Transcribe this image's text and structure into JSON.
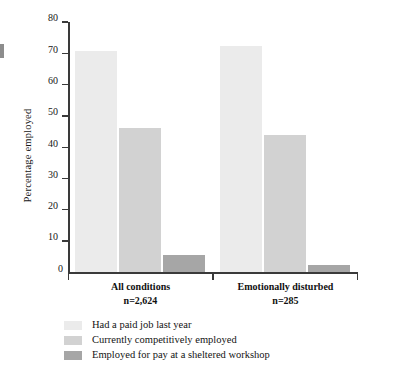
{
  "chart_data": {
    "type": "bar",
    "title": "",
    "xlabel": "",
    "ylabel": "Percentage employed",
    "ylim": [
      0,
      80
    ],
    "ytick_labels": [
      "0",
      "10",
      "20",
      "30",
      "40",
      "50",
      "60",
      "70",
      "80"
    ],
    "ytick_values": [
      0,
      10,
      20,
      30,
      40,
      50,
      60,
      70,
      80
    ],
    "grid": false,
    "legend_position": "bottom-left",
    "categories": [
      "All conditions",
      "Emotionally disturbed"
    ],
    "category_sublabels": [
      "n=2,624",
      "n=285"
    ],
    "series": [
      {
        "name": "Had a paid job last year",
        "color": "#ebebeb",
        "values": [
          70.8,
          72.4
        ]
      },
      {
        "name": "Currently competitively employed",
        "color": "#d2d2d2",
        "values": [
          46.2,
          43.8
        ]
      },
      {
        "name": "Employed for pay at a sheltered workshop",
        "color": "#a6a6a6",
        "values": [
          5.6,
          2.4
        ]
      }
    ]
  },
  "axis": {
    "y_title": "Percentage employed"
  },
  "legend": {
    "items": [
      {
        "label": "Had a paid job last year",
        "color": "#ebebeb"
      },
      {
        "label": "Currently competitively employed",
        "color": "#d2d2d2"
      },
      {
        "label": "Employed for pay at a sheltered workshop",
        "color": "#a6a6a6"
      }
    ]
  },
  "groups": [
    {
      "label": "All conditions",
      "n": "n=2,624"
    },
    {
      "label": "Emotionally disturbed",
      "n": "n=285"
    }
  ]
}
